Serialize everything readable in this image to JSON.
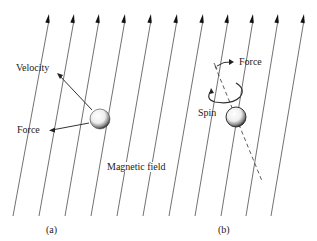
{
  "figure": {
    "labels": {
      "velocity": "Velocity",
      "force_a": "Force",
      "force_b": "Force",
      "spin": "Spin",
      "magnetic_field": "Magnetic field",
      "panel_a": "(a)",
      "panel_b": "(b)"
    },
    "colors": {
      "line": "#333333",
      "background": "#ffffff"
    },
    "field_lines": {
      "count": 11,
      "tops_x": [
        49,
        74,
        99,
        125,
        151,
        177,
        203,
        228,
        253,
        278,
        304
      ],
      "top_y": 14,
      "bottoms_x": [
        13,
        39,
        65,
        91,
        117,
        143,
        169,
        195,
        221,
        246,
        271
      ],
      "bottom_y": 216
    }
  }
}
